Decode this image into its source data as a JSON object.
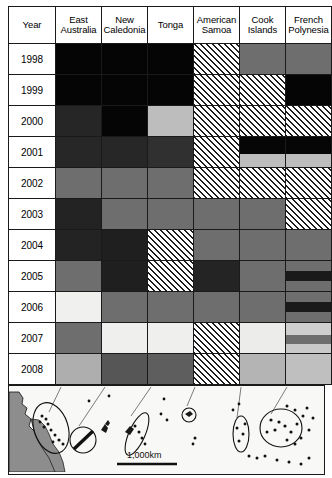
{
  "figure": {
    "type": "matrix-heatmap-with-map",
    "columns": [
      {
        "key": "year",
        "label": "Year"
      },
      {
        "key": "east_australia",
        "label": "East Australia"
      },
      {
        "key": "new_caledonia",
        "label": "New Caledonia"
      },
      {
        "key": "tonga",
        "label": "Tonga"
      },
      {
        "key": "american_samoa",
        "label": "American Samoa"
      },
      {
        "key": "cook_islands",
        "label": "Cook Islands"
      },
      {
        "key": "french_polynesia",
        "label": "French Polynesia"
      }
    ],
    "years": [
      "1998",
      "1999",
      "2000",
      "2001",
      "2002",
      "2003",
      "2004",
      "2005",
      "2006",
      "2007",
      "2008"
    ],
    "legend_shades": {
      "black": "#050505",
      "very-dark": "#232323",
      "dark": "#2e2e2e",
      "mid-dark": "#4a4a4a",
      "mid": "#6e6e6e",
      "mid-light": "#8a8a8a",
      "light": "#b4b4b4",
      "very-light": "#d8d8d8",
      "near-white": "#f0f0ee",
      "hatched": "diagonal-hatch"
    }
  },
  "chart_data": {
    "type": "heatmap",
    "title": "",
    "xlabel": "",
    "ylabel": "Year",
    "grid": true,
    "legend": "none",
    "categories": [
      "East Australia",
      "New Caledonia",
      "Tonga",
      "American Samoa",
      "Cook Islands",
      "French Polynesia"
    ],
    "x": [
      "1998",
      "1999",
      "2000",
      "2001",
      "2002",
      "2003",
      "2004",
      "2005",
      "2006",
      "2007",
      "2008"
    ],
    "cells": [
      {
        "year": "1998",
        "values": [
          {
            "region": "East Australia",
            "shade": "black",
            "fill": "#050505"
          },
          {
            "region": "New Caledonia",
            "shade": "black",
            "fill": "#050505"
          },
          {
            "region": "Tonga",
            "shade": "black",
            "fill": "#050505"
          },
          {
            "region": "American Samoa",
            "shade": "hatched",
            "fill": "hatch"
          },
          {
            "region": "Cook Islands",
            "shade": "mid",
            "fill": "#6e6e6e"
          },
          {
            "region": "French Polynesia",
            "shade": "mid",
            "fill": "#6e6e6e"
          }
        ]
      },
      {
        "year": "1999",
        "values": [
          {
            "region": "East Australia",
            "shade": "black",
            "fill": "#050505"
          },
          {
            "region": "New Caledonia",
            "shade": "black",
            "fill": "#050505"
          },
          {
            "region": "Tonga",
            "shade": "black",
            "fill": "#050505"
          },
          {
            "region": "American Samoa",
            "shade": "hatched",
            "fill": "hatch"
          },
          {
            "region": "Cook Islands",
            "shade": "hatched",
            "fill": "hatch"
          },
          {
            "region": "French Polynesia",
            "shade": "black",
            "fill": "#050505"
          }
        ]
      },
      {
        "year": "2000",
        "values": [
          {
            "region": "East Australia",
            "shade": "very-dark",
            "fill": "#262626"
          },
          {
            "region": "New Caledonia",
            "shade": "black",
            "fill": "#050505"
          },
          {
            "region": "Tonga",
            "shade": "light",
            "fill": "#bdbdbd"
          },
          {
            "region": "American Samoa",
            "shade": "hatched",
            "fill": "hatch"
          },
          {
            "region": "Cook Islands",
            "shade": "hatched",
            "fill": "hatch"
          },
          {
            "region": "French Polynesia",
            "shade": "hatched",
            "fill": "hatch"
          }
        ]
      },
      {
        "year": "2001",
        "values": [
          {
            "region": "East Australia",
            "shade": "very-dark",
            "fill": "#272727"
          },
          {
            "region": "New Caledonia",
            "shade": "very-dark",
            "fill": "#272727"
          },
          {
            "region": "Tonga",
            "shade": "dark",
            "fill": "#303030"
          },
          {
            "region": "American Samoa",
            "shade": "hatched",
            "fill": "hatch"
          },
          {
            "region": "Cook Islands",
            "shade": "split-black-light",
            "fill": "#050505 / #b9b9b9"
          },
          {
            "region": "French Polynesia",
            "shade": "split-black-light",
            "fill": "#050505 / #c2c2c2"
          }
        ]
      },
      {
        "year": "2002",
        "values": [
          {
            "region": "East Australia",
            "shade": "mid",
            "fill": "#6e6e6e"
          },
          {
            "region": "New Caledonia",
            "shade": "mid",
            "fill": "#6e6e6e"
          },
          {
            "region": "Tonga",
            "shade": "mid",
            "fill": "#6e6e6e"
          },
          {
            "region": "American Samoa",
            "shade": "hatched",
            "fill": "hatch"
          },
          {
            "region": "Cook Islands",
            "shade": "hatched",
            "fill": "hatch"
          },
          {
            "region": "French Polynesia",
            "shade": "hatched",
            "fill": "hatch"
          }
        ]
      },
      {
        "year": "2003",
        "values": [
          {
            "region": "East Australia",
            "shade": "very-dark",
            "fill": "#232323"
          },
          {
            "region": "New Caledonia",
            "shade": "mid",
            "fill": "#6e6e6e"
          },
          {
            "region": "Tonga",
            "shade": "mid",
            "fill": "#6e6e6e"
          },
          {
            "region": "American Samoa",
            "shade": "mid",
            "fill": "#6e6e6e"
          },
          {
            "region": "Cook Islands",
            "shade": "mid",
            "fill": "#6e6e6e"
          },
          {
            "region": "French Polynesia",
            "shade": "hatched",
            "fill": "hatch"
          }
        ]
      },
      {
        "year": "2004",
        "values": [
          {
            "region": "East Australia",
            "shade": "very-dark",
            "fill": "#232323"
          },
          {
            "region": "New Caledonia",
            "shade": "very-dark",
            "fill": "#1f1f1f"
          },
          {
            "region": "Tonga",
            "shade": "hatched",
            "fill": "hatch"
          },
          {
            "region": "American Samoa",
            "shade": "mid",
            "fill": "#6e6e6e"
          },
          {
            "region": "Cook Islands",
            "shade": "mid",
            "fill": "#6e6e6e"
          },
          {
            "region": "French Polynesia",
            "shade": "mid",
            "fill": "#6e6e6e"
          }
        ]
      },
      {
        "year": "2005",
        "values": [
          {
            "region": "East Australia",
            "shade": "mid",
            "fill": "#6e6e6e"
          },
          {
            "region": "New Caledonia",
            "shade": "very-dark",
            "fill": "#1f1f1f"
          },
          {
            "region": "Tonga",
            "shade": "hatched",
            "fill": "hatch"
          },
          {
            "region": "American Samoa",
            "shade": "very-dark",
            "fill": "#242424"
          },
          {
            "region": "Cook Islands",
            "shade": "mid",
            "fill": "#6e6e6e"
          },
          {
            "region": "French Polynesia",
            "shade": "banded-dark",
            "fill": "#6e6e6e / #1a1a1a"
          }
        ]
      },
      {
        "year": "2006",
        "values": [
          {
            "region": "East Australia",
            "shade": "near-white",
            "fill": "#f0f0ee"
          },
          {
            "region": "New Caledonia",
            "shade": "mid",
            "fill": "#6e6e6e"
          },
          {
            "region": "Tonga",
            "shade": "mid",
            "fill": "#6e6e6e"
          },
          {
            "region": "American Samoa",
            "shade": "mid",
            "fill": "#6e6e6e"
          },
          {
            "region": "Cook Islands",
            "shade": "mid",
            "fill": "#6e6e6e"
          },
          {
            "region": "French Polynesia",
            "shade": "banded-dark",
            "fill": "#6e6e6e / #1a1a1a"
          }
        ]
      },
      {
        "year": "2007",
        "values": [
          {
            "region": "East Australia",
            "shade": "mid",
            "fill": "#6e6e6e"
          },
          {
            "region": "New Caledonia",
            "shade": "near-white",
            "fill": "#efefed"
          },
          {
            "region": "Tonga",
            "shade": "near-white",
            "fill": "#efefed"
          },
          {
            "region": "American Samoa",
            "shade": "hatched",
            "fill": "hatch"
          },
          {
            "region": "Cook Islands",
            "shade": "near-white",
            "fill": "#ececea"
          },
          {
            "region": "French Polynesia",
            "shade": "banded-light",
            "fill": "#cfcfcf / #6e6e6e"
          }
        ]
      },
      {
        "year": "2008",
        "values": [
          {
            "region": "East Australia",
            "shade": "light",
            "fill": "#aeaeae"
          },
          {
            "region": "New Caledonia",
            "shade": "mid-dark",
            "fill": "#565656"
          },
          {
            "region": "Tonga",
            "shade": "mid-dark",
            "fill": "#5e5e5e"
          },
          {
            "region": "American Samoa",
            "shade": "hatched",
            "fill": "hatch"
          },
          {
            "region": "Cook Islands",
            "shade": "light",
            "fill": "#b4b4b4"
          },
          {
            "region": "French Polynesia",
            "shade": "light",
            "fill": "#bfbfbf"
          }
        ]
      }
    ]
  },
  "map": {
    "name": "south-pacific-locator-map",
    "scale_label": "1,000km",
    "landmass": "Australia east coast",
    "marker_shape": "ellipse",
    "marker_count": 6
  }
}
